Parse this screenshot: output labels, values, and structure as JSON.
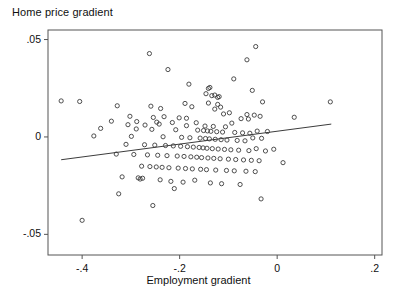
{
  "chart_data": {
    "type": "scatter",
    "title": "Home price gradient",
    "xlabel": "Employment gradient",
    "ylabel": "Home price gradient",
    "xlim": [
      -0.47,
      0.215
    ],
    "ylim": [
      -0.0606,
      0.0549
    ],
    "grid": false,
    "legend": null,
    "xticks": [
      -0.4,
      -0.2,
      0,
      0.2
    ],
    "xticklabels": [
      "-.4",
      "-.2",
      "0",
      ".2"
    ],
    "yticks": [
      0.05,
      0,
      -0.05
    ],
    "yticklabels": [
      ".05",
      "0",
      "-.05"
    ],
    "marker": "open-circle",
    "marker_color": "#3c3c3c",
    "fit_line": {
      "name": "linear fit",
      "x": [
        -0.443,
        0.111
      ],
      "y": [
        -0.0117,
        0.0066
      ],
      "color": "#3c3c3c"
    },
    "points": [
      {
        "x": -0.044,
        "y": 0.0464
      },
      {
        "x": -0.262,
        "y": 0.0428
      },
      {
        "x": -0.062,
        "y": 0.0396
      },
      {
        "x": -0.224,
        "y": 0.0346
      },
      {
        "x": -0.089,
        "y": 0.0298
      },
      {
        "x": -0.181,
        "y": 0.0271
      },
      {
        "x": -0.138,
        "y": 0.0254
      },
      {
        "x": -0.141,
        "y": 0.0249
      },
      {
        "x": -0.051,
        "y": 0.0239
      },
      {
        "x": -0.146,
        "y": 0.0222
      },
      {
        "x": -0.128,
        "y": 0.0215
      },
      {
        "x": -0.134,
        "y": 0.0212
      },
      {
        "x": -0.119,
        "y": 0.0207
      },
      {
        "x": -0.122,
        "y": 0.0203
      },
      {
        "x": -0.443,
        "y": 0.0185
      },
      {
        "x": -0.405,
        "y": 0.0182
      },
      {
        "x": -0.03,
        "y": 0.018
      },
      {
        "x": 0.109,
        "y": 0.018
      },
      {
        "x": -0.141,
        "y": 0.0174
      },
      {
        "x": -0.189,
        "y": 0.0172
      },
      {
        "x": -0.122,
        "y": 0.0167
      },
      {
        "x": -0.328,
        "y": 0.016
      },
      {
        "x": -0.259,
        "y": 0.0158
      },
      {
        "x": -0.175,
        "y": 0.0155
      },
      {
        "x": -0.116,
        "y": 0.0153
      },
      {
        "x": -0.239,
        "y": 0.0146
      },
      {
        "x": -0.128,
        "y": 0.0143
      },
      {
        "x": -0.098,
        "y": 0.0124
      },
      {
        "x": -0.11,
        "y": 0.0118
      },
      {
        "x": -0.062,
        "y": 0.0115
      },
      {
        "x": -0.047,
        "y": 0.0112
      },
      {
        "x": -0.302,
        "y": 0.0106
      },
      {
        "x": -0.232,
        "y": 0.0104
      },
      {
        "x": -0.254,
        "y": 0.01
      },
      {
        "x": -0.201,
        "y": 0.0098
      },
      {
        "x": -0.186,
        "y": 0.0096
      },
      {
        "x": -0.074,
        "y": 0.0094
      },
      {
        "x": -0.059,
        "y": 0.0092
      },
      {
        "x": -0.035,
        "y": 0.0106
      },
      {
        "x": 0.035,
        "y": 0.0101
      },
      {
        "x": -0.34,
        "y": 0.0081
      },
      {
        "x": -0.288,
        "y": 0.0079
      },
      {
        "x": -0.247,
        "y": 0.0076
      },
      {
        "x": -0.215,
        "y": 0.0074
      },
      {
        "x": -0.166,
        "y": 0.0073
      },
      {
        "x": -0.093,
        "y": 0.0071
      },
      {
        "x": -0.242,
        "y": 0.0066
      },
      {
        "x": -0.306,
        "y": 0.0063
      },
      {
        "x": -0.271,
        "y": 0.0061
      },
      {
        "x": -0.186,
        "y": 0.0058
      },
      {
        "x": -0.148,
        "y": 0.0056
      },
      {
        "x": -0.131,
        "y": 0.0054
      },
      {
        "x": -0.106,
        "y": 0.0052
      },
      {
        "x": -0.362,
        "y": 0.0044
      },
      {
        "x": -0.289,
        "y": 0.0041
      },
      {
        "x": -0.257,
        "y": 0.0039
      },
      {
        "x": -0.208,
        "y": 0.0037
      },
      {
        "x": -0.163,
        "y": 0.0035
      },
      {
        "x": -0.151,
        "y": 0.0033
      },
      {
        "x": -0.143,
        "y": 0.0031
      },
      {
        "x": -0.136,
        "y": 0.0029
      },
      {
        "x": -0.124,
        "y": 0.0027
      },
      {
        "x": -0.112,
        "y": 0.0025
      },
      {
        "x": -0.087,
        "y": 0.0023
      },
      {
        "x": -0.071,
        "y": 0.0021
      },
      {
        "x": -0.056,
        "y": 0.0019
      },
      {
        "x": -0.041,
        "y": 0.003
      },
      {
        "x": -0.02,
        "y": 0.0028
      },
      {
        "x": -0.376,
        "y": 0.0005
      },
      {
        "x": -0.299,
        "y": 0.0003
      },
      {
        "x": -0.234,
        "y": 0.0001
      },
      {
        "x": -0.196,
        "y": -0.0002
      },
      {
        "x": -0.179,
        "y": -0.0004
      },
      {
        "x": -0.158,
        "y": -0.0006
      },
      {
        "x": -0.147,
        "y": -0.0008
      },
      {
        "x": -0.139,
        "y": -0.001
      },
      {
        "x": -0.127,
        "y": -0.0012
      },
      {
        "x": -0.115,
        "y": -0.0014
      },
      {
        "x": -0.103,
        "y": -0.0016
      },
      {
        "x": -0.082,
        "y": -0.0018
      },
      {
        "x": -0.066,
        "y": -0.002
      },
      {
        "x": -0.05,
        "y": -0.0005
      },
      {
        "x": -0.032,
        "y": -0.0007
      },
      {
        "x": -0.31,
        "y": -0.0038
      },
      {
        "x": -0.272,
        "y": -0.004
      },
      {
        "x": -0.251,
        "y": -0.0042
      },
      {
        "x": -0.229,
        "y": -0.0044
      },
      {
        "x": -0.213,
        "y": -0.0046
      },
      {
        "x": -0.198,
        "y": -0.0048
      },
      {
        "x": -0.184,
        "y": -0.005
      },
      {
        "x": -0.172,
        "y": -0.0052
      },
      {
        "x": -0.16,
        "y": -0.0054
      },
      {
        "x": -0.152,
        "y": -0.0056
      },
      {
        "x": -0.144,
        "y": -0.0058
      },
      {
        "x": -0.133,
        "y": -0.006
      },
      {
        "x": -0.121,
        "y": -0.0062
      },
      {
        "x": -0.108,
        "y": -0.0064
      },
      {
        "x": -0.095,
        "y": -0.0066
      },
      {
        "x": -0.079,
        "y": -0.0068
      },
      {
        "x": -0.058,
        "y": -0.007
      },
      {
        "x": -0.043,
        "y": -0.006
      },
      {
        "x": -0.024,
        "y": -0.0072
      },
      {
        "x": -0.007,
        "y": -0.0063
      },
      {
        "x": -0.33,
        "y": -0.0088
      },
      {
        "x": -0.294,
        "y": -0.009
      },
      {
        "x": -0.266,
        "y": -0.0092
      },
      {
        "x": -0.245,
        "y": -0.0094
      },
      {
        "x": -0.226,
        "y": -0.0096
      },
      {
        "x": -0.205,
        "y": -0.0098
      },
      {
        "x": -0.191,
        "y": -0.01
      },
      {
        "x": -0.177,
        "y": -0.0102
      },
      {
        "x": -0.165,
        "y": -0.0104
      },
      {
        "x": -0.155,
        "y": -0.0106
      },
      {
        "x": -0.142,
        "y": -0.0108
      },
      {
        "x": -0.13,
        "y": -0.011
      },
      {
        "x": -0.117,
        "y": -0.0112
      },
      {
        "x": -0.1,
        "y": -0.0114
      },
      {
        "x": -0.085,
        "y": -0.0116
      },
      {
        "x": -0.069,
        "y": -0.0118
      },
      {
        "x": -0.053,
        "y": -0.012
      },
      {
        "x": -0.037,
        "y": -0.0122
      },
      {
        "x": 0.012,
        "y": -0.0132
      },
      {
        "x": -0.278,
        "y": -0.015
      },
      {
        "x": -0.261,
        "y": -0.0152
      },
      {
        "x": -0.248,
        "y": -0.0154
      },
      {
        "x": -0.236,
        "y": -0.0156
      },
      {
        "x": -0.222,
        "y": -0.0158
      },
      {
        "x": -0.203,
        "y": -0.016
      },
      {
        "x": -0.188,
        "y": -0.0162
      },
      {
        "x": -0.174,
        "y": -0.0164
      },
      {
        "x": -0.157,
        "y": -0.0166
      },
      {
        "x": -0.145,
        "y": -0.0168
      },
      {
        "x": -0.126,
        "y": -0.017
      },
      {
        "x": -0.104,
        "y": -0.0172
      },
      {
        "x": -0.088,
        "y": -0.0174
      },
      {
        "x": -0.064,
        "y": -0.0176
      },
      {
        "x": -0.045,
        "y": -0.0178
      },
      {
        "x": -0.318,
        "y": -0.0205
      },
      {
        "x": -0.285,
        "y": -0.021
      },
      {
        "x": -0.281,
        "y": -0.0216
      },
      {
        "x": -0.276,
        "y": -0.0212
      },
      {
        "x": -0.24,
        "y": -0.022
      },
      {
        "x": -0.218,
        "y": -0.0228
      },
      {
        "x": -0.193,
        "y": -0.0232
      },
      {
        "x": -0.169,
        "y": -0.0222
      },
      {
        "x": -0.137,
        "y": -0.0236
      },
      {
        "x": -0.114,
        "y": -0.024
      },
      {
        "x": -0.076,
        "y": -0.0244
      },
      {
        "x": -0.033,
        "y": -0.0318
      },
      {
        "x": -0.211,
        "y": -0.0265
      },
      {
        "x": -0.325,
        "y": -0.0292
      },
      {
        "x": -0.255,
        "y": -0.0352
      },
      {
        "x": -0.4,
        "y": -0.0428
      }
    ]
  }
}
